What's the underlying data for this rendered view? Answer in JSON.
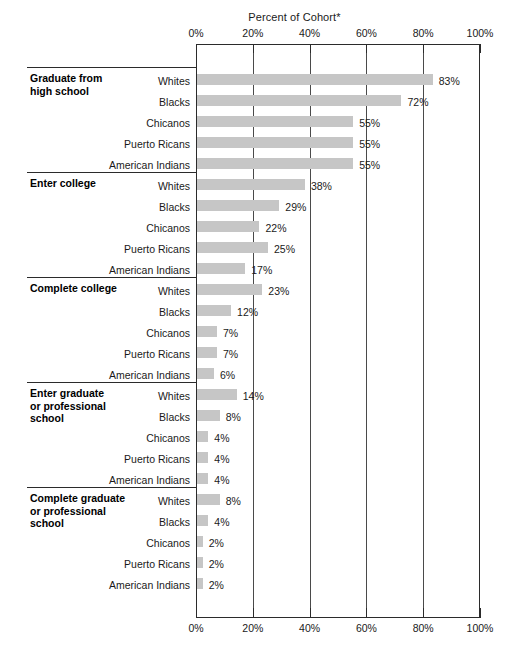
{
  "chart_data": {
    "type": "bar",
    "title": "Percent of Cohort*",
    "xlabel": "",
    "ylabel": "",
    "xlim": [
      0,
      100
    ],
    "xticks": [
      "0%",
      "20%",
      "40%",
      "60%",
      "80%",
      "100%"
    ],
    "xtick_values": [
      0,
      20,
      40,
      60,
      80,
      100
    ],
    "grid": true,
    "legend": "none",
    "orientation": "horizontal",
    "categories": [
      "Whites",
      "Blacks",
      "Chicanos",
      "Puerto Ricans",
      "American Indians"
    ],
    "groups": [
      {
        "name": "Graduate from high school",
        "title_lines": [
          "Graduate from",
          "high school"
        ],
        "rows": [
          {
            "label": "Whites",
            "value": 83,
            "value_label": "83%"
          },
          {
            "label": "Blacks",
            "value": 72,
            "value_label": "72%"
          },
          {
            "label": "Chicanos",
            "value": 55,
            "value_label": "55%"
          },
          {
            "label": "Puerto Ricans",
            "value": 55,
            "value_label": "55%"
          },
          {
            "label": "American Indians",
            "value": 55,
            "value_label": "55%"
          }
        ]
      },
      {
        "name": "Enter college",
        "title_lines": [
          "Enter college"
        ],
        "rows": [
          {
            "label": "Whites",
            "value": 38,
            "value_label": "38%"
          },
          {
            "label": "Blacks",
            "value": 29,
            "value_label": "29%"
          },
          {
            "label": "Chicanos",
            "value": 22,
            "value_label": "22%"
          },
          {
            "label": "Puerto Ricans",
            "value": 25,
            "value_label": "25%"
          },
          {
            "label": "American Indians",
            "value": 17,
            "value_label": "17%"
          }
        ]
      },
      {
        "name": "Complete college",
        "title_lines": [
          "Complete college"
        ],
        "rows": [
          {
            "label": "Whites",
            "value": 23,
            "value_label": "23%"
          },
          {
            "label": "Blacks",
            "value": 12,
            "value_label": "12%"
          },
          {
            "label": "Chicanos",
            "value": 7,
            "value_label": "7%"
          },
          {
            "label": "Puerto Ricans",
            "value": 7,
            "value_label": "7%"
          },
          {
            "label": "American Indians",
            "value": 6,
            "value_label": "6%"
          }
        ]
      },
      {
        "name": "Enter graduate or professional school",
        "title_lines": [
          "Enter graduate",
          "or professional",
          "school"
        ],
        "rows": [
          {
            "label": "Whites",
            "value": 14,
            "value_label": "14%"
          },
          {
            "label": "Blacks",
            "value": 8,
            "value_label": "8%"
          },
          {
            "label": "Chicanos",
            "value": 4,
            "value_label": "4%"
          },
          {
            "label": "Puerto Ricans",
            "value": 4,
            "value_label": "4%"
          },
          {
            "label": "American Indians",
            "value": 4,
            "value_label": "4%"
          }
        ]
      },
      {
        "name": "Complete graduate or professional school",
        "title_lines": [
          "Complete graduate",
          "or professional",
          "school"
        ],
        "rows": [
          {
            "label": "Whites",
            "value": 8,
            "value_label": "8%"
          },
          {
            "label": "Blacks",
            "value": 4,
            "value_label": "4%"
          },
          {
            "label": "Chicanos",
            "value": 2,
            "value_label": "2%"
          },
          {
            "label": "Puerto Ricans",
            "value": 2,
            "value_label": "2%"
          },
          {
            "label": "American Indians",
            "value": 2,
            "value_label": "2%"
          }
        ]
      }
    ],
    "colors": {
      "bar": "#c6c6c6",
      "axis": "#2b2b2b",
      "grid": "#4a4a4a",
      "text": "#1a1a1a",
      "background": "#ffffff"
    }
  }
}
